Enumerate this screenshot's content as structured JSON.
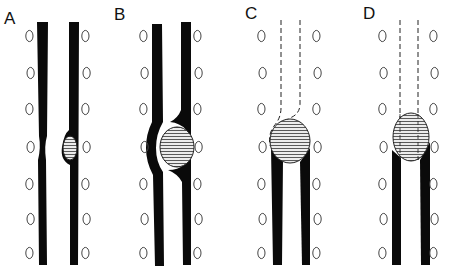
{
  "figure": {
    "panels": [
      {
        "id": "A",
        "label": "A",
        "stage": "small bolus bulging the right wall, left wall indented"
      },
      {
        "id": "B",
        "label": "B",
        "stage": "large bolus expanding both walls"
      },
      {
        "id": "C",
        "label": "C",
        "stage": "bolus at end of solid tube, dashed continuation above"
      },
      {
        "id": "D",
        "label": "D",
        "stage": "bolus exiting solid tube into dashed straight channel"
      }
    ],
    "colors": {
      "wall": "#0a0a0a",
      "cell_outline": "#444444",
      "bolus_fill": "#ececec",
      "bolus_hatch": "#333333",
      "dashed": "#222222",
      "background": "#ffffff"
    }
  }
}
